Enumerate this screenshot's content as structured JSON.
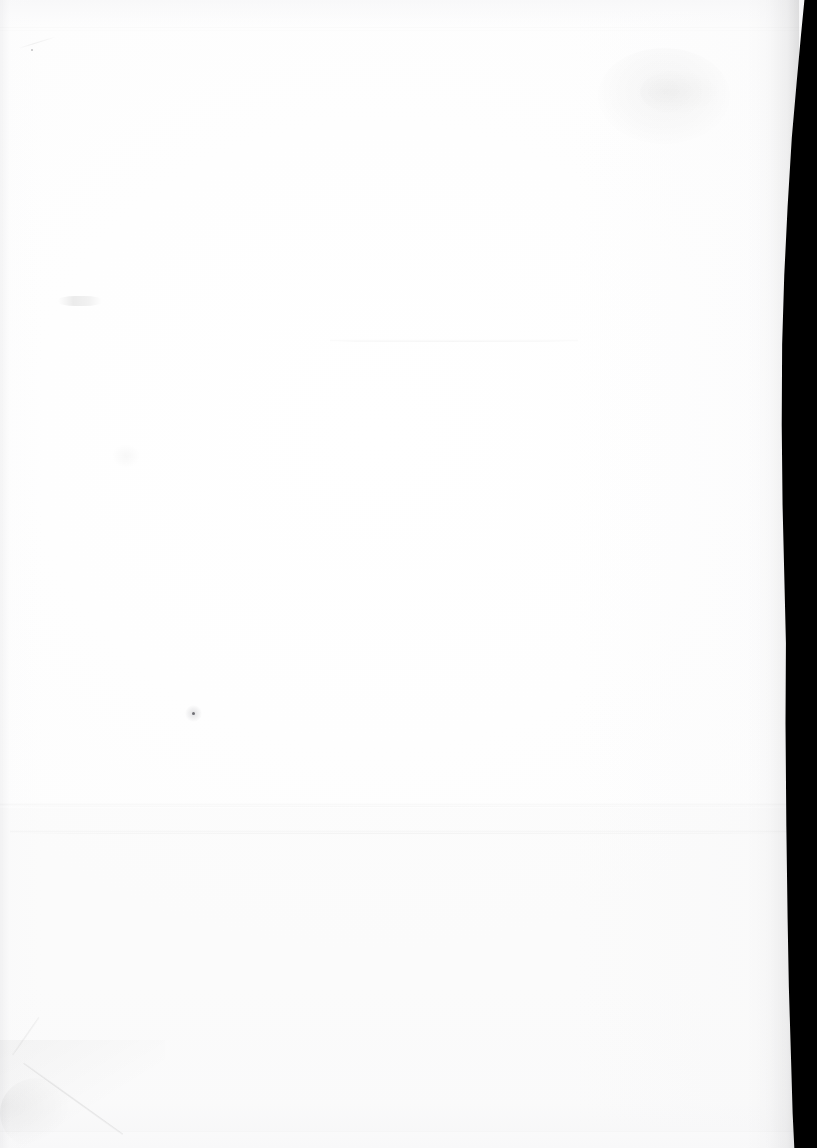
{
  "document": {
    "kind": "scanned-page",
    "content_text": "",
    "description": "Blank scanned page — no printed text or graphics visible",
    "width_px": 817,
    "height_px": 1148
  },
  "colors": {
    "paper": "#ffffff",
    "paper_shade": "#fdfdfd",
    "gutter_black": "#000000",
    "crease_ink": "#000000",
    "speck": "#282830"
  },
  "artifacts": {
    "gutter": {
      "name": "binding-gutter-shadow",
      "edge": "right",
      "width_px": 42
    },
    "creases": [
      {
        "name": "top-paper-edge-line",
        "x": 0,
        "y": 28,
        "width": 817,
        "opacity": 0.4
      },
      {
        "name": "mid-page-crease",
        "x": 337,
        "y": 341,
        "width": 231,
        "opacity": 0.55
      },
      {
        "name": "main-horizontal-fold",
        "x": 0,
        "y": 806,
        "width": 817,
        "opacity": 0.45
      },
      {
        "name": "secondary-fold",
        "x": 14,
        "y": 833,
        "width": 790,
        "opacity": 0.6
      },
      {
        "name": "bottom-paper-edge",
        "x": 0,
        "y": 1132,
        "width": 817,
        "opacity": 0.35
      }
    ],
    "smudges": [
      {
        "name": "upper-right-smudge",
        "x": 598,
        "y": 48,
        "width": 132,
        "height": 96,
        "opacity": 0.03
      },
      {
        "name": "left-margin-smudge",
        "x": 58,
        "y": 296,
        "width": 42,
        "height": 9,
        "opacity": 0.07
      },
      {
        "name": "lower-left-smudge",
        "x": 112,
        "y": 444,
        "width": 26,
        "height": 22,
        "opacity": 0.025
      }
    ],
    "specks": [
      {
        "name": "dust-speck-primary",
        "x": 193,
        "y": 713,
        "size": 3
      },
      {
        "name": "dust-speck-upper",
        "x": 31,
        "y": 49,
        "size": 2
      }
    ],
    "corner_fold": {
      "name": "dog-eared-bottom-left-corner",
      "x": 0,
      "y": 1040,
      "width": 160,
      "height": 108
    }
  }
}
